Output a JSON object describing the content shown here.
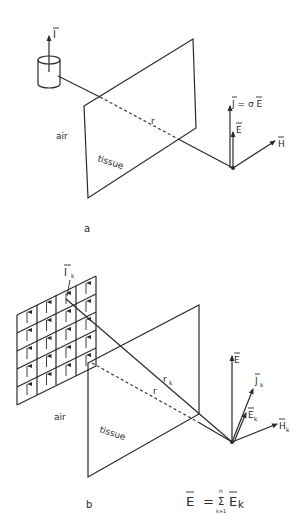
{
  "figure_a": {
    "panel_label": "a",
    "source_label": "I",
    "plane_label_air": "air",
    "plane_label_tissue": "tissue",
    "distance_label": "r",
    "vector_J": "J = σ E",
    "vector_E": "E",
    "vector_H": "H"
  },
  "figure_b": {
    "panel_label": "b",
    "source_label": "I",
    "source_subscript": "k",
    "grid_columns": 4,
    "grid_rows": 5,
    "plane_label_air": "air",
    "plane_label_tissue": "tissue",
    "distance_label_rk": "r",
    "distance_label_rk_sub": "k",
    "distance_label_r": "r",
    "vector_E": "E",
    "vector_Jk": "J",
    "vector_Ek": "E",
    "vector_Hk": "H",
    "subscript_k": "k",
    "equation": {
      "lhs": "E",
      "equals": "=",
      "sum_symbol": "Σ",
      "sum_upper": "n",
      "sum_lower": "k=1",
      "term": "E",
      "term_sub": "k"
    }
  }
}
